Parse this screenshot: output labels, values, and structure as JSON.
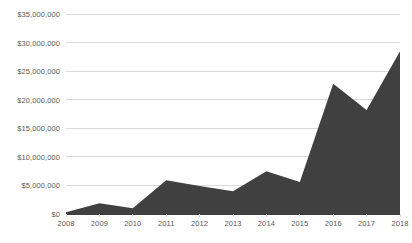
{
  "chart_data": {
    "type": "area",
    "title": "",
    "subtitle": "",
    "xlabel": "",
    "ylabel": "",
    "categories": [
      "2008",
      "2009",
      "2010",
      "2011",
      "2012",
      "2013",
      "2014",
      "2015",
      "2016",
      "2017",
      "2018"
    ],
    "values": [
      300000,
      1900000,
      1000000,
      5900000,
      4900000,
      4000000,
      7500000,
      5600000,
      22800000,
      18200000,
      28500000
    ],
    "ylim": [
      0,
      35000000
    ],
    "xlim": [
      "2008",
      "2018"
    ],
    "y_tick_values": [
      0,
      5000000,
      10000000,
      15000000,
      20000000,
      25000000,
      30000000,
      35000000
    ],
    "y_tick_labels": [
      "$0",
      "$5,000,000",
      "$10,000,000",
      "$15,000,000",
      "$20,000,000",
      "$25,000,000",
      "$30,000,000",
      "$35,000,000"
    ],
    "x_tick_labels": [
      "2008",
      "2009",
      "2010",
      "2011",
      "2012",
      "2013",
      "2014",
      "2015",
      "2016",
      "2017",
      "2018"
    ],
    "grid": true,
    "grid_axis": "y",
    "legend": false,
    "legend_position": "none",
    "series": [
      {
        "name": "Series 1",
        "values": [
          300000,
          1900000,
          1000000,
          5900000,
          4900000,
          4000000,
          7500000,
          5600000,
          22800000,
          18200000,
          28500000
        ]
      }
    ]
  },
  "style": {
    "area_fill_color": "#404040",
    "gridline_color": "#d9d9d9",
    "axis_line_color": "#404040",
    "tick_label_color": "#595959",
    "background_color": "#ffffff"
  }
}
